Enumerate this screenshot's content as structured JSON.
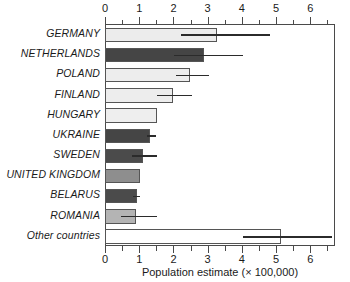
{
  "chart_data": {
    "type": "bar",
    "orientation": "horizontal",
    "title": "",
    "xlabel": "Population estimate (× 100,000)",
    "ylabel": "",
    "xlim": [
      0,
      6.72
    ],
    "xticks": [
      0,
      1,
      2,
      3,
      4,
      5,
      6
    ],
    "xtick_labels": [
      "0",
      "1",
      "2",
      "3",
      "4",
      "5",
      "6"
    ],
    "minor_tick_step": 0.5,
    "grid": false,
    "legend": "none",
    "axis_positions": [
      "top",
      "bottom"
    ],
    "categories": [
      "GERMANY",
      "NETHERLANDS",
      "POLAND",
      "FINLAND",
      "HUNGARY",
      "UKRAINE",
      "SWEDEN",
      "UNITED KINGDOM",
      "BELARUS",
      "ROMANIA",
      "Other countries"
    ],
    "values": [
      3.25,
      2.85,
      2.45,
      1.95,
      1.5,
      1.3,
      1.07,
      1.0,
      0.9,
      0.88,
      5.1
    ],
    "error_low": [
      2.2,
      2.0,
      2.05,
      1.5,
      null,
      1.2,
      0.75,
      null,
      0.8,
      0.45,
      4.0
    ],
    "error_high": [
      4.8,
      4.0,
      3.0,
      2.5,
      null,
      1.45,
      1.5,
      null,
      1.0,
      1.5,
      6.6
    ],
    "bar_colors": [
      "#ececec",
      "#454545",
      "#ededed",
      "#ededed",
      "#eeeeee",
      "#454545",
      "#4b4b4b",
      "#8e8e8e",
      "#4b4b4b",
      "#b4b4b4",
      "#ffffff"
    ],
    "bar_border_color": "#555555",
    "error_bar_color": "#2b2b2b",
    "axis_color": "#4a4a4a",
    "text_color": "#1a1a1a",
    "background": "#ffffff"
  }
}
